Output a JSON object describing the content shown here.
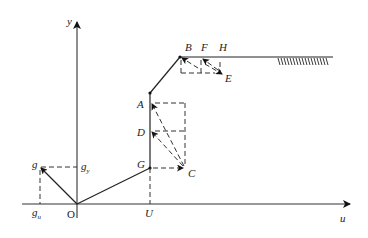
{
  "diagram": {
    "axes": {
      "x_label": "u",
      "y_label": "y",
      "origin_label": "O"
    },
    "points": {
      "B": "B",
      "F": "F",
      "H": "H",
      "E": "E",
      "A": "A",
      "D": "D",
      "G": "G",
      "C": "C",
      "U": "U",
      "g": "g",
      "g_y_base": "g",
      "g_y_sub": "y",
      "g_u_base": "g",
      "g_u_sub": "u"
    },
    "colors": {
      "line": "#222222",
      "background": "#ffffff"
    }
  }
}
